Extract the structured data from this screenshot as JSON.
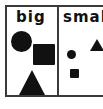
{
  "figure": {
    "kind": "two-panel-comparison-diagram",
    "caption_text": "",
    "frame_color": "#3a3a3a",
    "background_color": "#ffffff",
    "shape_fill_color": "#111111"
  },
  "panels": [
    {
      "id": "big",
      "label": "big",
      "shapes": [
        {
          "name": "circle",
          "label": "",
          "size": "large"
        },
        {
          "name": "square",
          "label": "",
          "size": "large"
        },
        {
          "name": "triangle",
          "label": "",
          "size": "large"
        }
      ]
    },
    {
      "id": "small",
      "label": "small",
      "label_clipped": "smal",
      "shapes": [
        {
          "name": "circle",
          "label": "",
          "size": "small"
        },
        {
          "name": "triangle",
          "label": "",
          "size": "small"
        },
        {
          "name": "square",
          "label": "",
          "size": "small"
        }
      ]
    }
  ],
  "chart_data": {
    "type": "table",
    "title": "",
    "xlabel": "",
    "ylabel": "",
    "categories": [
      "big",
      "small"
    ],
    "series": [
      {
        "name": "circle",
        "values": [
          "large",
          "small"
        ]
      },
      {
        "name": "square",
        "values": [
          "large",
          "small"
        ]
      },
      {
        "name": "triangle",
        "values": [
          "large",
          "small"
        ]
      }
    ],
    "legend": [],
    "annotations": []
  }
}
